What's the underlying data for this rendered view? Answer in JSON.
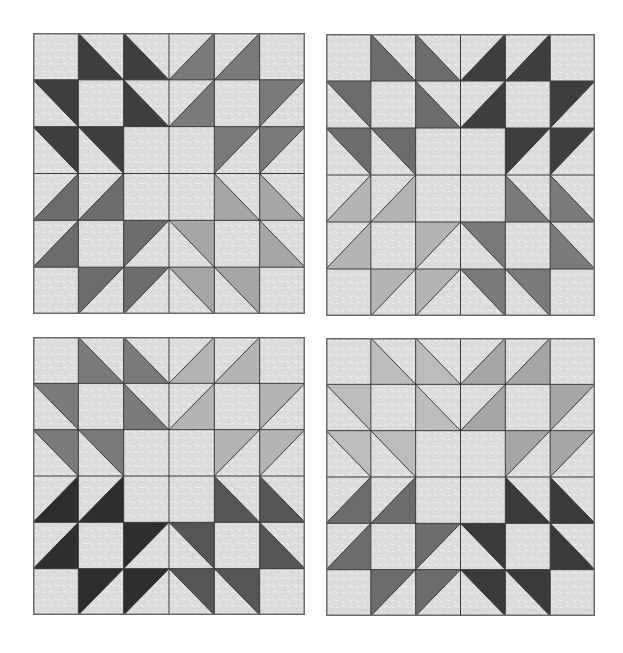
{
  "palette": {
    "background": "#dcdcdc",
    "line": "#3a3a3a",
    "dark": "#3e3e3e",
    "darkmed": "#555555",
    "medium": "#6c6c6c",
    "medium2": "#7a7a7a",
    "lightmed": "#a6a6a6",
    "light": "#bdbdbd"
  },
  "grid": {
    "rows": 6,
    "cols": 6
  },
  "arms": {
    "tl": [
      [
        0,
        1,
        "BL"
      ],
      [
        0,
        2,
        "BL"
      ],
      [
        1,
        0,
        "TR"
      ],
      [
        1,
        2,
        "BL"
      ],
      [
        2,
        0,
        "TR"
      ],
      [
        2,
        1,
        "TR"
      ]
    ],
    "tr": [
      [
        0,
        3,
        "BR"
      ],
      [
        0,
        4,
        "BR"
      ],
      [
        1,
        3,
        "BR"
      ],
      [
        1,
        5,
        "TL"
      ],
      [
        2,
        4,
        "TL"
      ],
      [
        2,
        5,
        "TL"
      ]
    ],
    "bl": [
      [
        3,
        0,
        "BR"
      ],
      [
        3,
        1,
        "BR"
      ],
      [
        4,
        0,
        "BR"
      ],
      [
        4,
        2,
        "TL"
      ],
      [
        5,
        1,
        "TL"
      ],
      [
        5,
        2,
        "TL"
      ]
    ],
    "br": [
      [
        3,
        4,
        "BL"
      ],
      [
        3,
        5,
        "BL"
      ],
      [
        4,
        3,
        "TR"
      ],
      [
        4,
        5,
        "BL"
      ],
      [
        5,
        3,
        "TR"
      ],
      [
        5,
        4,
        "TR"
      ]
    ]
  },
  "blocks": [
    {
      "name": "block-top-left",
      "x": 33,
      "y": 33,
      "w": 272,
      "h": 281,
      "colors": {
        "tl": "#3e3e3e",
        "tr": "#7a7a7a",
        "bl": "#6c6c6c",
        "br": "#a6a6a6"
      }
    },
    {
      "name": "block-top-right",
      "x": 326,
      "y": 34,
      "w": 269,
      "h": 282,
      "colors": {
        "tl": "#6c6c6c",
        "tr": "#3e3e3e",
        "bl": "#b4b4b4",
        "br": "#7a7a7a"
      }
    },
    {
      "name": "block-bottom-left",
      "x": 33,
      "y": 337,
      "w": 272,
      "h": 278,
      "colors": {
        "tl": "#7a7a7a",
        "tr": "#b4b4b4",
        "bl": "#2e2e2e",
        "br": "#555555"
      }
    },
    {
      "name": "block-bottom-right",
      "x": 326,
      "y": 338,
      "w": 269,
      "h": 278,
      "colors": {
        "tl": "#bdbdbd",
        "tr": "#a6a6a6",
        "bl": "#6c6c6c",
        "br": "#3a3a3a"
      }
    }
  ]
}
